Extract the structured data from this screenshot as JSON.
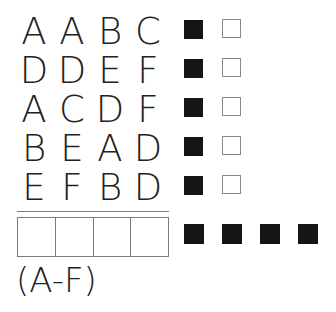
{
  "puzzle": {
    "guesses": [
      {
        "letters": [
          "A",
          "A",
          "B",
          "C"
        ],
        "correct_position": 1,
        "correct_letter_wrong_position": 1
      },
      {
        "letters": [
          "D",
          "D",
          "E",
          "F"
        ],
        "correct_position": 1,
        "correct_letter_wrong_position": 1
      },
      {
        "letters": [
          "A",
          "C",
          "D",
          "F"
        ],
        "correct_position": 1,
        "correct_letter_wrong_position": 1
      },
      {
        "letters": [
          "B",
          "E",
          "A",
          "D"
        ],
        "correct_position": 1,
        "correct_letter_wrong_position": 1
      },
      {
        "letters": [
          "E",
          "F",
          "B",
          "D"
        ],
        "correct_position": 1,
        "correct_letter_wrong_position": 1
      }
    ],
    "answer_cells": [
      "",
      "",
      "",
      ""
    ],
    "answer_feedback": [
      "black",
      "black",
      "black",
      "black"
    ],
    "hint": "(A-F)",
    "colors": {
      "black_peg": "#151515",
      "white_peg_border": "#8a8a8a",
      "line": "#7a7a7a"
    }
  }
}
